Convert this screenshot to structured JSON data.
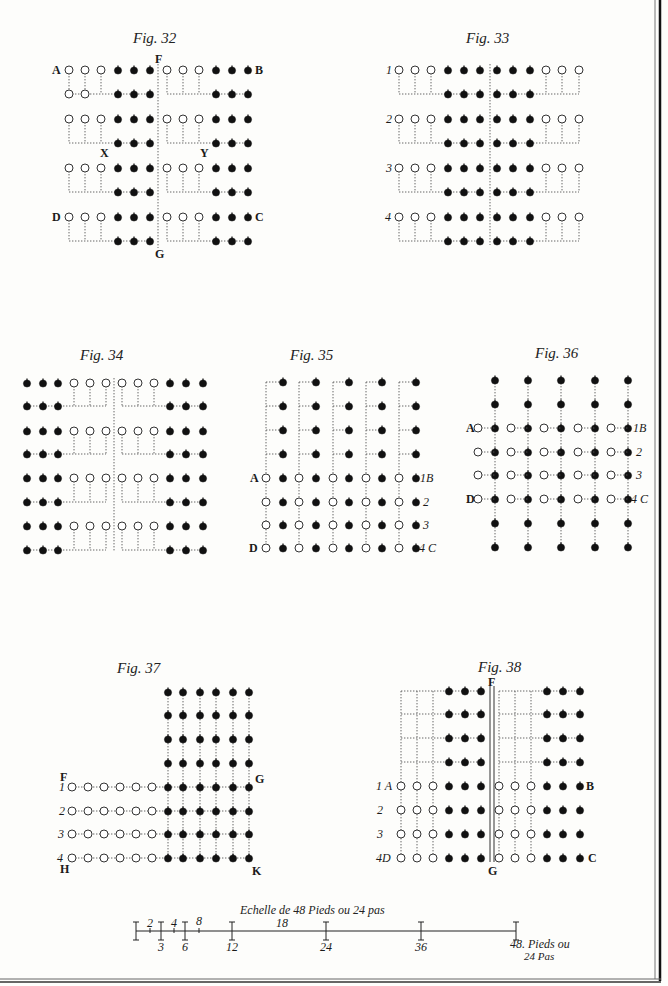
{
  "plate": {
    "background": "#fdfdfb",
    "ink": "#111111",
    "border": {
      "right_x": 660,
      "bottom_y": 980
    }
  },
  "figures": [
    {
      "id": "fig32",
      "title": "Fig. 32",
      "title_pos": [
        133,
        43
      ],
      "rows_y": [
        70,
        94,
        119,
        143,
        168,
        192,
        217,
        241
      ],
      "divider": {
        "x": 158,
        "y1": 64,
        "y2": 248
      },
      "labels": [
        {
          "t": "A",
          "x": 52,
          "y": 74
        },
        {
          "t": "B",
          "x": 255,
          "y": 74
        },
        {
          "t": "F",
          "x": 155,
          "y": 63
        },
        {
          "t": "X",
          "x": 100,
          "y": 157
        },
        {
          "t": "Y",
          "x": 200,
          "y": 157
        },
        {
          "t": "D",
          "x": 52,
          "y": 221
        },
        {
          "t": "C",
          "x": 255,
          "y": 221
        },
        {
          "t": "G",
          "x": 155,
          "y": 258
        }
      ]
    },
    {
      "id": "fig33",
      "title": "Fig. 33",
      "title_pos": [
        466,
        43
      ],
      "rows_y": [
        70,
        94,
        119,
        143,
        168,
        192,
        217,
        241
      ],
      "divider": {
        "x": 490,
        "y1": 64,
        "y2": 245
      },
      "labels": [
        {
          "t": "1",
          "x": 386,
          "y": 74
        },
        {
          "t": "2",
          "x": 386,
          "y": 123
        },
        {
          "t": "3",
          "x": 386,
          "y": 172
        },
        {
          "t": "4",
          "x": 385,
          "y": 221
        }
      ]
    },
    {
      "id": "fig34",
      "title": "Fig. 34",
      "title_pos": [
        80,
        360
      ],
      "rows_y": [
        383,
        406,
        431,
        454,
        478,
        502,
        526,
        550
      ],
      "divider": {
        "x": 114,
        "y1": 378,
        "y2": 552
      },
      "labels": []
    },
    {
      "id": "fig35",
      "title": "Fig. 35",
      "title_pos": [
        290,
        360
      ],
      "rows_y": [
        382,
        406,
        430,
        454,
        478,
        502,
        525,
        548
      ],
      "labels": [
        {
          "t": "A",
          "x": 250,
          "y": 482
        },
        {
          "t": "1B",
          "x": 420,
          "y": 482
        },
        {
          "t": "2",
          "x": 423,
          "y": 506
        },
        {
          "t": "3",
          "x": 423,
          "y": 529
        },
        {
          "t": "D",
          "x": 249,
          "y": 552
        },
        {
          "t": "4 C",
          "x": 419,
          "y": 552
        }
      ]
    },
    {
      "id": "fig36",
      "title": "Fig. 36",
      "title_pos": [
        535,
        358
      ],
      "rows_y": [
        380,
        404,
        428,
        452,
        475,
        499,
        523,
        547
      ],
      "labels": [
        {
          "t": "A",
          "x": 466,
          "y": 432
        },
        {
          "t": "1B",
          "x": 633,
          "y": 432
        },
        {
          "t": "2",
          "x": 636,
          "y": 456
        },
        {
          "t": "3",
          "x": 636,
          "y": 479
        },
        {
          "t": "D",
          "x": 466,
          "y": 503
        },
        {
          "t": "4 C",
          "x": 631,
          "y": 503
        }
      ]
    },
    {
      "id": "fig37",
      "title": "Fig. 37",
      "title_pos": [
        117,
        673
      ],
      "rows_y": [
        692,
        715,
        739,
        763,
        787,
        811,
        834,
        858
      ],
      "labels": [
        {
          "t": "F",
          "x": 60,
          "y": 781
        },
        {
          "t": "1",
          "x": 59,
          "y": 791
        },
        {
          "t": "2",
          "x": 59,
          "y": 815
        },
        {
          "t": "3",
          "x": 58,
          "y": 838
        },
        {
          "t": "4",
          "x": 57,
          "y": 862
        },
        {
          "t": "H",
          "x": 60,
          "y": 873
        },
        {
          "t": "G",
          "x": 255,
          "y": 783
        },
        {
          "t": "K",
          "x": 252,
          "y": 875
        }
      ]
    },
    {
      "id": "fig38",
      "title": "Fig. 38",
      "title_pos": [
        478,
        672
      ],
      "rows_y": [
        691,
        714,
        738,
        762,
        786,
        810,
        834,
        858
      ],
      "divider": {
        "x1": 490,
        "x2": 494,
        "y1": 686,
        "y2": 862
      },
      "labels": [
        {
          "t": "F",
          "x": 488,
          "y": 686
        },
        {
          "t": "1 A",
          "x": 376,
          "y": 790
        },
        {
          "t": "B",
          "x": 586,
          "y": 790
        },
        {
          "t": "2",
          "x": 377,
          "y": 814
        },
        {
          "t": "3",
          "x": 377,
          "y": 838
        },
        {
          "t": "4D",
          "x": 376,
          "y": 862
        },
        {
          "t": "C",
          "x": 588,
          "y": 862
        },
        {
          "t": "G",
          "x": 488,
          "y": 875
        }
      ]
    }
  ],
  "scale_bar": {
    "title": "Echelle de 48 Pieds ou 24 pas",
    "title_pos": [
      240,
      914
    ],
    "y": 931,
    "x0": 136,
    "x48": 516,
    "major_ticks": [
      {
        "v": "0",
        "x": 136
      },
      {
        "v": "3",
        "x": 161
      },
      {
        "v": "6",
        "x": 185
      },
      {
        "v": "12",
        "x": 232
      },
      {
        "v": "24",
        "x": 326
      },
      {
        "v": "36",
        "x": 421
      },
      {
        "v": "48",
        "x": 516
      }
    ],
    "minor_ticks": [
      {
        "v": "2",
        "x": 150
      },
      {
        "v": "4",
        "x": 174
      },
      {
        "v": "8",
        "x": 199
      },
      {
        "v": "18",
        "x": 279
      }
    ],
    "end_label_line1": "48. Pieds ou",
    "end_label_line2": "24 Pas"
  }
}
